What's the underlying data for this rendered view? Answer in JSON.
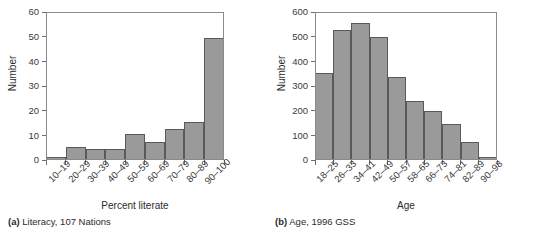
{
  "figure": {
    "panels": [
      {
        "key": "a",
        "caption_tag": "(a)",
        "caption_text": "Literacy, 107 Nations",
        "y_title": "Number",
        "x_title": "Percent literate",
        "y_ticks": [
          "0",
          "10",
          "20",
          "30",
          "40",
          "50",
          "60"
        ],
        "x_labels": [
          "10–19",
          "20–29",
          "30–39",
          "40–49",
          "50–59",
          "60–69",
          "70–79",
          "80–89",
          "90–100"
        ]
      },
      {
        "key": "b",
        "caption_tag": "(b)",
        "caption_text": "Age, 1996 GSS",
        "y_title": "Number",
        "x_title": "Age",
        "y_ticks": [
          "0",
          "100",
          "200",
          "300",
          "400",
          "500",
          "600"
        ],
        "x_labels": [
          "18–25",
          "26–33",
          "34–41",
          "42–49",
          "50–57",
          "58–65",
          "66–73",
          "74–81",
          "82–89",
          "90–98"
        ]
      }
    ],
    "colors": {
      "bar_fill": "#9a9a9a",
      "bar_edge": "#5a5a5a",
      "frame": "#8a8a8a",
      "text": "#2b2b2b",
      "background": "#ffffff"
    }
  },
  "chart_data": [
    {
      "type": "bar",
      "panel": "a",
      "title": "Literacy, 107 Nations",
      "xlabel": "Percent literate",
      "ylabel": "Number",
      "categories": [
        "10–19",
        "20–29",
        "30–39",
        "40–49",
        "50–59",
        "60–69",
        "70–79",
        "80–89",
        "90–100"
      ],
      "values": [
        1,
        5,
        4,
        4,
        10,
        7,
        12,
        15,
        49
      ],
      "ylim": [
        0,
        60
      ],
      "ytick_step": 10,
      "yticks": [
        0,
        10,
        20,
        30,
        40,
        50,
        60
      ],
      "grid": false,
      "legend": null,
      "bar_gap": 0,
      "orientation": "vertical"
    },
    {
      "type": "bar",
      "panel": "b",
      "title": "Age, 1996 GSS",
      "xlabel": "Age",
      "ylabel": "Number",
      "categories": [
        "18–25",
        "26–33",
        "34–41",
        "42–49",
        "50–57",
        "58–65",
        "66–73",
        "74–81",
        "82–89",
        "90–98"
      ],
      "values": [
        350,
        522,
        550,
        493,
        333,
        235,
        196,
        140,
        68,
        10
      ],
      "ylim": [
        0,
        600
      ],
      "ytick_step": 100,
      "yticks": [
        0,
        100,
        200,
        300,
        400,
        500,
        600
      ],
      "grid": false,
      "legend": null,
      "bar_gap": 0,
      "orientation": "vertical"
    }
  ]
}
